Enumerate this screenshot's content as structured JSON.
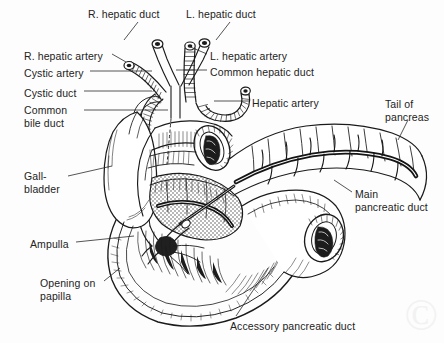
{
  "figure": {
    "width": 444,
    "height": 343,
    "background_color": "#fdfdfd",
    "ink_color": "#1a1a1a",
    "label_color": "#232323"
  },
  "labels": [
    {
      "id": "r-hepatic-duct",
      "text": "R. hepatic duct",
      "x": 88,
      "y": 8,
      "align": "left"
    },
    {
      "id": "l-hepatic-duct",
      "text": "L. hepatic duct",
      "x": 186,
      "y": 8,
      "align": "left"
    },
    {
      "id": "r-hepatic-artery",
      "text": "R. hepatic artery",
      "x": 24,
      "y": 50,
      "align": "left"
    },
    {
      "id": "l-hepatic-artery",
      "text": "L. hepatic artery",
      "x": 210,
      "y": 50,
      "align": "left"
    },
    {
      "id": "cystic-artery",
      "text": "Cystic artery",
      "x": 24,
      "y": 67,
      "align": "left"
    },
    {
      "id": "common-hepatic-duct",
      "text": "Common hepatic duct",
      "x": 210,
      "y": 66,
      "align": "left"
    },
    {
      "id": "cystic-duct",
      "text": "Cystic duct",
      "x": 24,
      "y": 87,
      "align": "left"
    },
    {
      "id": "hepatic-artery",
      "text": "Hepatic artery",
      "x": 252,
      "y": 97,
      "align": "left"
    },
    {
      "id": "common-bile-duct",
      "text": "Common\nbile duct",
      "x": 24,
      "y": 104,
      "align": "left"
    },
    {
      "id": "tail-of-pancreas",
      "text": "Tail of\npancreas",
      "x": 385,
      "y": 98,
      "align": "left"
    },
    {
      "id": "gallbladder",
      "text": "Gall-\nbladder",
      "x": 24,
      "y": 170,
      "align": "left"
    },
    {
      "id": "main-pancreatic-duct",
      "text": "Main\npancreatic duct",
      "x": 355,
      "y": 188,
      "align": "left"
    },
    {
      "id": "ampulla",
      "text": "Ampulla",
      "x": 30,
      "y": 238,
      "align": "left"
    },
    {
      "id": "opening-on-papilla",
      "text": "Opening on\npapilla",
      "x": 40,
      "y": 277,
      "align": "left"
    },
    {
      "id": "accessory-pancreatic-duct",
      "text": "Accessory pancreatic duct",
      "x": 230,
      "y": 320,
      "align": "left"
    }
  ],
  "leader_lines": [
    {
      "id": "leader-r-hepatic-duct",
      "from": [
        138,
        22
      ],
      "to": [
        124,
        40
      ]
    },
    {
      "id": "leader-l-hepatic-duct",
      "from": [
        230,
        22
      ],
      "to": [
        216,
        40
      ]
    },
    {
      "id": "leader-r-hepatic-artery",
      "from": [
        112,
        54
      ],
      "to": [
        126,
        62
      ]
    },
    {
      "id": "leader-cystic-artery",
      "from": [
        90,
        71
      ],
      "to": [
        152,
        71
      ]
    },
    {
      "id": "leader-cystic-duct",
      "from": [
        84,
        91
      ],
      "to": [
        152,
        91
      ]
    },
    {
      "id": "leader-common-bile-duct",
      "from": [
        84,
        110
      ],
      "to": [
        168,
        110
      ]
    },
    {
      "id": "leader-l-hepatic-artery",
      "from": [
        207,
        54
      ],
      "to": [
        188,
        46
      ]
    },
    {
      "id": "leader-common-hepatic-duct",
      "from": [
        207,
        70
      ],
      "to": [
        176,
        70
      ]
    },
    {
      "id": "leader-hepatic-artery",
      "from": [
        249,
        101
      ],
      "to": [
        214,
        101
      ]
    },
    {
      "id": "leader-tail-of-pancreas",
      "from": [
        408,
        120
      ],
      "to": [
        398,
        140
      ]
    },
    {
      "id": "leader-gallbladder",
      "from": [
        68,
        176
      ],
      "to": [
        112,
        166
      ]
    },
    {
      "id": "leader-main-pancreatic-duct",
      "from": [
        352,
        192
      ],
      "to": [
        334,
        180
      ]
    },
    {
      "id": "leader-ampulla",
      "from": [
        76,
        242
      ],
      "to": [
        134,
        236
      ]
    },
    {
      "id": "leader-opening-on-papilla",
      "from": [
        104,
        281
      ],
      "to": [
        120,
        268
      ]
    },
    {
      "id": "leader-accessory-duct",
      "from": [
        236,
        316
      ],
      "to": [
        268,
        268
      ]
    }
  ],
  "watermark": {
    "text": "©",
    "visible": true
  }
}
